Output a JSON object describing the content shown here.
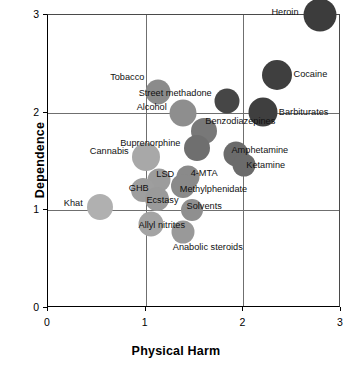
{
  "chart_data": {
    "type": "scatter",
    "title": "",
    "xlabel": "Physical Harm",
    "ylabel": "Dependence",
    "xlim": [
      0,
      3
    ],
    "ylim": [
      0,
      3
    ],
    "xticks": [
      "0",
      "1",
      "2",
      "3"
    ],
    "yticks": [
      "0",
      "1",
      "2",
      "3"
    ],
    "grid": true,
    "legend": "none",
    "marker": "bubble",
    "note": "Bubble area encodes relative scale; shade encodes class (dark = most harmful).",
    "points": [
      {
        "label": "Heroin",
        "x": 2.78,
        "y": 3.0,
        "r": 16.5,
        "color": "#3c3c3c",
        "label_dx": -20,
        "label_dy": -1,
        "anchor": "end"
      },
      {
        "label": "Cocaine",
        "x": 2.34,
        "y": 2.39,
        "r": 15.0,
        "color": "#3f3f3f",
        "label_dx": 18,
        "label_dy": 1,
        "anchor": "start"
      },
      {
        "label": "Barbiturates",
        "x": 2.2,
        "y": 2.01,
        "r": 14.5,
        "color": "#3f3f3f",
        "label_dx": 17,
        "label_dy": 2,
        "anchor": "start"
      },
      {
        "label": "Street methadone",
        "x": 1.83,
        "y": 2.12,
        "r": 12.5,
        "color": "#464646",
        "label_dx": -14,
        "label_dy": -6,
        "anchor": "end"
      },
      {
        "label": "Tobacco",
        "x": 1.13,
        "y": 2.21,
        "r": 12.5,
        "color": "#8b8b8b",
        "label_dx": -13,
        "label_dy": -13,
        "anchor": "end"
      },
      {
        "label": "Alcohol",
        "x": 1.38,
        "y": 2.0,
        "r": 13.5,
        "color": "#8e8e8e",
        "label_dx": -15,
        "label_dy": -4,
        "anchor": "end"
      },
      {
        "label": "Benzodiazepines",
        "x": 1.6,
        "y": 1.81,
        "r": 13.0,
        "color": "#787878",
        "label_dx": 2,
        "label_dy": -8,
        "anchor": "start"
      },
      {
        "label": "Buprenorphine",
        "x": 1.53,
        "y": 1.64,
        "r": 13.0,
        "color": "#6f6f6f",
        "label_dx": -16,
        "label_dy": -3,
        "anchor": "end"
      },
      {
        "label": "Amphetamine",
        "x": 1.93,
        "y": 1.58,
        "r": 12.5,
        "color": "#6b6b6b",
        "label_dx": -4,
        "label_dy": -2,
        "anchor": "start"
      },
      {
        "label": "Ketamine",
        "x": 2.01,
        "y": 1.46,
        "r": 11.5,
        "color": "#6b6b6b",
        "label_dx": 3,
        "label_dy": 2,
        "anchor": "start"
      },
      {
        "label": "Cannabis",
        "x": 1.0,
        "y": 1.55,
        "r": 14.0,
        "color": "#a8a8a8",
        "label_dx": -16,
        "label_dy": -4,
        "anchor": "end"
      },
      {
        "label": "4-MTA",
        "x": 1.43,
        "y": 1.34,
        "r": 11.5,
        "color": "#8a8a8a",
        "label_dx": 4,
        "label_dy": -2,
        "anchor": "start"
      },
      {
        "label": "Methylphenidate",
        "x": 1.38,
        "y": 1.25,
        "r": 12.0,
        "color": "#8a8a8a",
        "label_dx": -2,
        "label_dy": 5,
        "anchor": "start"
      },
      {
        "label": "LSD",
        "x": 1.14,
        "y": 1.31,
        "r": 11.5,
        "color": "#9c9c9c",
        "label_dx": -2,
        "label_dy": -4,
        "anchor": "start"
      },
      {
        "label": "GHB",
        "x": 0.97,
        "y": 1.21,
        "r": 12.0,
        "color": "#9e9e9e",
        "label_dx": -13,
        "label_dy": 0,
        "anchor": "start"
      },
      {
        "label": "Ecstasy",
        "x": 1.12,
        "y": 1.12,
        "r": 12.0,
        "color": "#9a9a9a",
        "label_dx": -10,
        "label_dy": 3,
        "anchor": "start"
      },
      {
        "label": "Solvents",
        "x": 1.47,
        "y": 1.0,
        "r": 11.0,
        "color": "#8f8f8f",
        "label_dx": -4,
        "label_dy": -2,
        "anchor": "start"
      },
      {
        "label": "Khat",
        "x": 0.53,
        "y": 1.03,
        "r": 13.0,
        "color": "#b0b0b0",
        "label_dx": -16,
        "label_dy": -2,
        "anchor": "end"
      },
      {
        "label": "Allyl nitrites",
        "x": 1.05,
        "y": 0.86,
        "r": 12.5,
        "color": "#a4a4a4",
        "label_dx": -11,
        "label_dy": 3,
        "anchor": "start"
      },
      {
        "label": "Anabolic steroids",
        "x": 1.38,
        "y": 0.78,
        "r": 11.5,
        "color": "#999999",
        "label_dx": -9,
        "label_dy": 17,
        "anchor": "start"
      }
    ]
  }
}
